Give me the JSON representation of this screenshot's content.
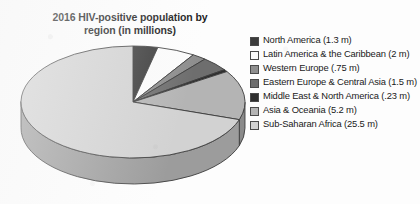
{
  "chart_data": {
    "type": "pie",
    "title": "2016 HIV-positive population by\nregion (in millions)",
    "xlabel": "",
    "ylabel": "",
    "unit": "millions",
    "legend_position": "right",
    "three_d": true,
    "start_angle_deg": 0,
    "direction": "clockwise",
    "total": 36.48,
    "categories": [
      "North America",
      "Latin America & the Caribbean",
      "Western Europe",
      "Eastern Europe & Central Asia",
      "Middle East & North America",
      "Asia & Oceania",
      "Sub-Saharan Africa"
    ],
    "values": [
      1.3,
      2,
      0.75,
      1.5,
      0.23,
      5.2,
      25.5
    ],
    "value_labels": [
      "1.3 m",
      "2 m",
      ".75 m",
      "1.5 m",
      ".23 m",
      "5.2 m",
      "25.5 m"
    ],
    "colors": [
      "#3c3c3c",
      "#fbfbfb",
      "#8e8e8e",
      "#6e6e6e",
      "#2e2e2e",
      "#b4b4b4",
      "#d2d2d2"
    ],
    "side_colors": [
      "#2a2a2a",
      "#c6c6c6",
      "#6a6a6a",
      "#525252",
      "#202020",
      "#8a8a8a",
      "#9c9c9c"
    ]
  },
  "legend": {
    "items": [
      {
        "label": "North America (1.3 m)",
        "color": "#3c3c3c"
      },
      {
        "label": "Latin America & the Caribbean (2 m)",
        "color": "#fbfbfb"
      },
      {
        "label": "Western Europe (.75 m)",
        "color": "#8e8e8e"
      },
      {
        "label": "Eastern Europe & Central Asia (1.5 m)",
        "color": "#6e6e6e"
      },
      {
        "label": "Middle East & North America (.23 m)",
        "color": "#2e2e2e"
      },
      {
        "label": "Asia & Oceania (5.2 m)",
        "color": "#b4b4b4"
      },
      {
        "label": "Sub-Saharan Africa (25.5 m)",
        "color": "#d2d2d2"
      }
    ]
  }
}
